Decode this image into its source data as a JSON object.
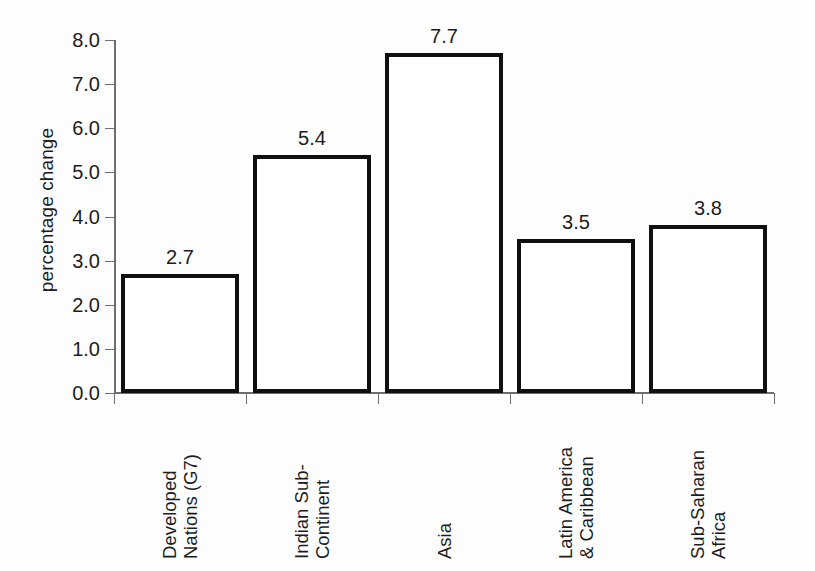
{
  "chart_data": {
    "type": "bar",
    "title": "",
    "xlabel": "",
    "ylabel": "percentage change",
    "categories": [
      "Developed Nations (G7)",
      "Indian Sub-Continent",
      "Asia",
      "Latin America & Caribbean",
      "Sub-Saharan Africa"
    ],
    "category_lines": [
      [
        "Developed",
        "Nations (G7)"
      ],
      [
        "Indian Sub-",
        "Continent"
      ],
      [
        "Asia"
      ],
      [
        "Latin America",
        "& Caribbean"
      ],
      [
        "Sub-Saharan",
        "Africa"
      ]
    ],
    "values": [
      2.7,
      5.4,
      7.7,
      3.5,
      3.8
    ],
    "value_labels": [
      "2.7",
      "5.4",
      "7.7",
      "3.5",
      "3.8"
    ],
    "ylim": [
      0.0,
      8.0
    ],
    "ytick_labels": [
      "0.0",
      "1.0",
      "2.0",
      "3.0",
      "4.0",
      "5.0",
      "6.0",
      "7.0",
      "8.0"
    ],
    "ytick_values": [
      0,
      1,
      2,
      3,
      4,
      5,
      6,
      7,
      8
    ],
    "grid": false,
    "legend": "none",
    "bar_fill_color": "#ffffff",
    "bar_edge_color": "#101010",
    "axis_color": "#6e6e6e",
    "background_color": "#fdfdfd"
  }
}
